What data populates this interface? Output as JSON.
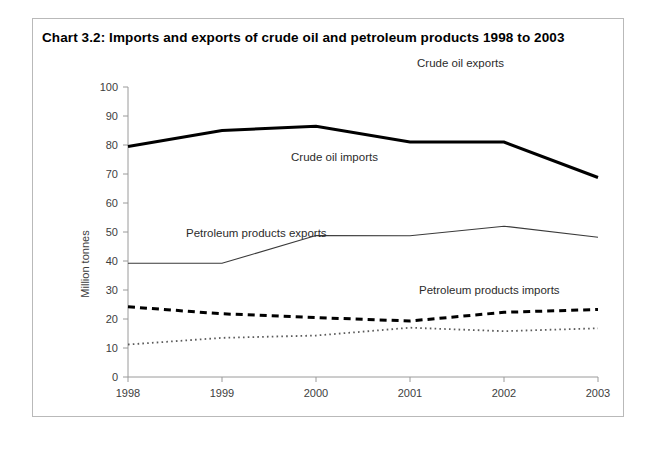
{
  "figure": {
    "title": "Chart 3.2:  Imports and exports of crude oil and petroleum products 1998 to 2003"
  },
  "chart_data": {
    "type": "line",
    "title": "Chart 3.2:  Imports and exports of crude oil and petroleum products 1998 to 2003",
    "xlabel": "",
    "ylabel": "Million tonnes",
    "categories": [
      "1998",
      "1999",
      "2000",
      "2001",
      "2002",
      "2003"
    ],
    "x_tick_labels": [
      "1998",
      "1999",
      "2000",
      "2001",
      "2002",
      "2003"
    ],
    "y_tick_labels": [
      "0",
      "10",
      "20",
      "30",
      "40",
      "50",
      "60",
      "70",
      "80",
      "90",
      "100"
    ],
    "y_ticks": [
      0,
      10,
      20,
      30,
      40,
      50,
      60,
      70,
      80,
      90,
      100
    ],
    "ylim": [
      0,
      100
    ],
    "grid": false,
    "legend_position": "inline-annotations",
    "series": [
      {
        "name": "Crude oil exports",
        "style": "solid-thick",
        "color": "#000000",
        "values": [
          79.5,
          85.0,
          86.5,
          81.0,
          81.0,
          68.8
        ],
        "annotation": "Crude oil exports"
      },
      {
        "name": "Crude oil imports",
        "style": "solid-thin",
        "color": "#3a3a3a",
        "values": [
          39.2,
          39.2,
          48.8,
          48.7,
          52.0,
          48.2
        ],
        "annotation": "Crude oil imports"
      },
      {
        "name": "Petroleum products exports",
        "style": "dashed-thick",
        "color": "#000000",
        "values": [
          24.2,
          21.8,
          20.5,
          19.3,
          22.3,
          23.3
        ],
        "annotation": "Petroleum products exports"
      },
      {
        "name": "Petroleum products imports",
        "style": "dotted",
        "color": "#5a5a5a",
        "values": [
          11.2,
          13.5,
          14.3,
          17.0,
          15.8,
          16.8
        ],
        "annotation": "Petroleum products imports"
      }
    ],
    "annotations": [
      {
        "text": "Crude oil exports",
        "x_px": 384,
        "y_px": 48
      },
      {
        "text": "Crude oil imports",
        "x_px": 258,
        "y_px": 142
      },
      {
        "text": "Petroleum products exports",
        "x_px": 153,
        "y_px": 218
      },
      {
        "text": "Petroleum products imports",
        "x_px": 386,
        "y_px": 275
      }
    ]
  }
}
